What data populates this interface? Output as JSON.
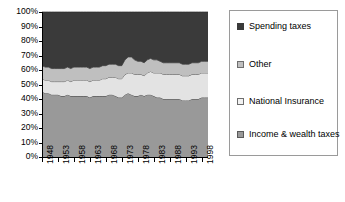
{
  "chart_data": {
    "type": "area",
    "stacked": true,
    "normalized_percent": true,
    "title": "",
    "xlabel": "",
    "ylabel": "",
    "ylim": [
      0,
      100
    ],
    "ytick_labels": [
      "100%",
      "90%",
      "80%",
      "70%",
      "60%",
      "50%",
      "40%",
      "30%",
      "20%",
      "10%",
      "0%"
    ],
    "ytick_values": [
      100,
      90,
      80,
      70,
      60,
      50,
      40,
      30,
      20,
      10,
      0
    ],
    "grid": false,
    "legend_position": "right",
    "x": [
      1948,
      1949,
      1950,
      1951,
      1952,
      1953,
      1954,
      1955,
      1956,
      1957,
      1958,
      1959,
      1960,
      1961,
      1962,
      1963,
      1964,
      1965,
      1966,
      1967,
      1968,
      1969,
      1970,
      1971,
      1972,
      1973,
      1974,
      1975,
      1976,
      1977,
      1978,
      1979,
      1980,
      1981,
      1982,
      1983,
      1984,
      1985,
      1986,
      1987,
      1988,
      1989,
      1990,
      1991,
      1992,
      1993,
      1994,
      1995,
      1996,
      1997,
      1998,
      1999,
      2000
    ],
    "xtick_labels": [
      "1948",
      "1953",
      "1958",
      "1963",
      "1968",
      "1973",
      "1978",
      "1983",
      "1988",
      "1993",
      "1998"
    ],
    "xtick_values": [
      1948,
      1953,
      1958,
      1963,
      1968,
      1973,
      1978,
      1983,
      1988,
      1993,
      1998
    ],
    "series": [
      {
        "name": "Income & wealth taxes",
        "color": "#999999",
        "stack_order": 1,
        "values": [
          45,
          44,
          44,
          43,
          43,
          43,
          42,
          42,
          43,
          42,
          42,
          42,
          42,
          42,
          42,
          41,
          42,
          42,
          42,
          42,
          42,
          43,
          43,
          42,
          41,
          41,
          43,
          44,
          43,
          42,
          42,
          43,
          42,
          43,
          43,
          42,
          41,
          41,
          40,
          40,
          40,
          40,
          40,
          40,
          39,
          39,
          39,
          40,
          40,
          40,
          41,
          41,
          41
        ]
      },
      {
        "name": "National Insurance",
        "color": "#e3e3e3",
        "stack_order": 2,
        "values": [
          9,
          9,
          9,
          9,
          9,
          9,
          10,
          10,
          10,
          10,
          11,
          11,
          11,
          11,
          11,
          11,
          11,
          11,
          11,
          12,
          12,
          12,
          12,
          13,
          13,
          13,
          14,
          14,
          15,
          15,
          15,
          14,
          14,
          15,
          16,
          16,
          17,
          17,
          17,
          17,
          17,
          17,
          17,
          17,
          17,
          17,
          17,
          17,
          17,
          17,
          17,
          17,
          17
        ]
      },
      {
        "name": "Other",
        "color": "#bfbfbf",
        "stack_order": 3,
        "values": [
          9,
          9,
          9,
          9,
          9,
          9,
          9,
          9,
          9,
          9,
          9,
          9,
          9,
          9,
          9,
          9,
          9,
          9,
          9,
          9,
          9,
          9,
          9,
          9,
          9,
          9,
          10,
          11,
          11,
          10,
          9,
          9,
          9,
          9,
          9,
          9,
          9,
          8,
          8,
          8,
          8,
          8,
          8,
          8,
          8,
          8,
          8,
          8,
          8,
          8,
          8,
          8,
          8
        ]
      },
      {
        "name": "Spending taxes",
        "color": "#3a3a3a",
        "stack_order": 4,
        "values": [
          37,
          38,
          38,
          39,
          39,
          39,
          39,
          39,
          38,
          39,
          38,
          38,
          38,
          38,
          38,
          39,
          38,
          38,
          38,
          37,
          37,
          36,
          36,
          36,
          37,
          37,
          33,
          31,
          31,
          33,
          34,
          34,
          35,
          33,
          32,
          33,
          33,
          34,
          35,
          35,
          35,
          35,
          35,
          35,
          36,
          36,
          36,
          35,
          35,
          35,
          34,
          34,
          34
        ]
      }
    ]
  },
  "legend": {
    "items": [
      {
        "label": "Spending taxes",
        "swatch": "#3a3a3a",
        "swatch_border": "#3a3a3a"
      },
      {
        "label": "Other",
        "swatch": "#bfbfbf",
        "swatch_border": "#6e6e6e"
      },
      {
        "label": "National Insurance",
        "swatch": "#f2f2f2",
        "swatch_border": "#6e6e6e"
      },
      {
        "label": "Income & wealth taxes",
        "swatch": "#999999",
        "swatch_border": "#5a5a5a"
      }
    ]
  },
  "axis": {
    "line_color": "#000000",
    "plot_left": 42,
    "plot_right": 208,
    "plot_top": 12,
    "plot_bottom": 157
  }
}
